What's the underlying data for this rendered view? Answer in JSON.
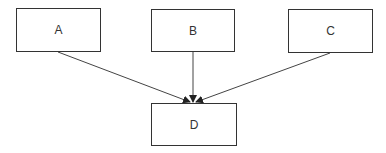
{
  "diagram": {
    "type": "flow",
    "nodes": [
      {
        "id": "A",
        "label": "A",
        "x": 16,
        "y": 8,
        "w": 85,
        "h": 44
      },
      {
        "id": "B",
        "label": "B",
        "x": 151,
        "y": 9,
        "w": 84,
        "h": 43
      },
      {
        "id": "C",
        "label": "C",
        "x": 288,
        "y": 9,
        "w": 85,
        "h": 44
      },
      {
        "id": "D",
        "label": "D",
        "x": 151,
        "y": 103,
        "w": 86,
        "h": 43
      }
    ],
    "edges": [
      {
        "from": "A",
        "to": "D"
      },
      {
        "from": "B",
        "to": "D"
      },
      {
        "from": "C",
        "to": "D"
      }
    ],
    "colors": {
      "stroke": "#333333",
      "background": "#ffffff"
    }
  }
}
